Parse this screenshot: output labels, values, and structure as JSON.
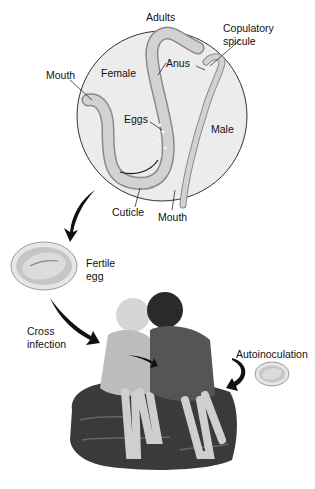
{
  "diagram": {
    "type": "pinworm-life-cycle",
    "colors": {
      "background": "#ffffff",
      "circle_fill": "#ededed",
      "worm_fill": "#c9c9c9",
      "worm_outline": "#8a8a8a",
      "egg_outer": "#d8d8d8",
      "egg_inner": "#bdbdbd",
      "arrow": "#111111",
      "rock": "#3c3c3c"
    },
    "adults_panel": {
      "title": "Adults",
      "labels": {
        "mouth_female": "Mouth",
        "female": "Female",
        "anus": "Anus",
        "copulatory_spicule_line1": "Copulatory",
        "copulatory_spicule_line2": "spicule",
        "eggs": "Eggs",
        "male": "Male",
        "cuticle": "Cuticle",
        "mouth_male": "Mouth"
      }
    },
    "fertile_egg": {
      "line1": "Fertile",
      "line2": "egg"
    },
    "cross_infection": {
      "line1": "Cross",
      "line2": "infection"
    },
    "autoinoculation": {
      "label": "Autoinoculation"
    }
  }
}
